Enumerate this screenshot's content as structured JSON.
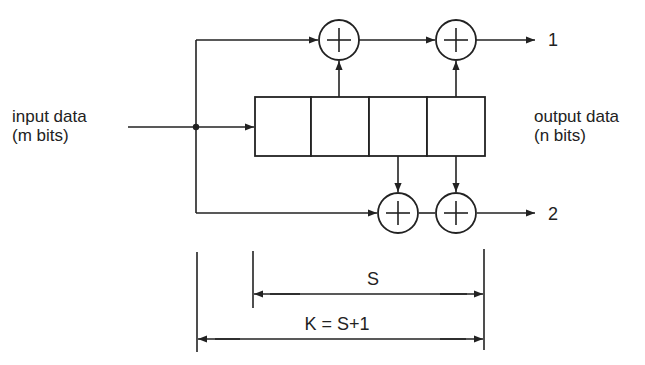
{
  "diagram": {
    "labels": {
      "input_line1": "input data",
      "input_line2": "(m bits)",
      "output_line1": "output data",
      "output_line2": "(n bits)",
      "output_1": "1",
      "output_2": "2",
      "span_s": "S",
      "span_k": "K = S+1"
    },
    "shift_register": {
      "cells": 4
    },
    "xor_gates": [
      {
        "id": "top-1",
        "symbol": "plus-circle-icon"
      },
      {
        "id": "top-2",
        "symbol": "plus-circle-icon"
      },
      {
        "id": "bottom-1",
        "symbol": "plus-circle-icon"
      },
      {
        "id": "bottom-2",
        "symbol": "plus-circle-icon"
      }
    ],
    "colors": {
      "stroke": "#222222",
      "background": "#ffffff"
    }
  }
}
